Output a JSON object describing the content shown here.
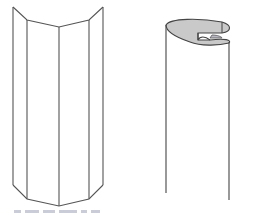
{
  "figure": {
    "left_shape": {
      "name": "folded-prism-panel",
      "stroke": "#555555",
      "top_polyline": [
        [
          13,
          7
        ],
        [
          27,
          20
        ],
        [
          59,
          27
        ],
        [
          89,
          20
        ],
        [
          103,
          7
        ]
      ],
      "bottom_polyline": [
        [
          13,
          185
        ],
        [
          27,
          199
        ],
        [
          59,
          206
        ],
        [
          89,
          199
        ],
        [
          103,
          185
        ]
      ],
      "vertical_edges_x": [
        13,
        27,
        59,
        89,
        103
      ]
    },
    "right_shape": {
      "name": "rolled-cylinder",
      "stroke": "#444444",
      "fill_top": "#c9c9c9",
      "left_edge": {
        "x": 166,
        "y1": 25,
        "y2": 193
      },
      "right_edge": {
        "x": 229,
        "y1": 42,
        "y2": 200
      }
    },
    "caption_partial": true
  }
}
